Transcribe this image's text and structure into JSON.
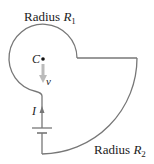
{
  "diagram": {
    "labels": {
      "radius1_prefix": "Radius ",
      "radius1_var": "R",
      "radius1_sub": "1",
      "radius2_prefix": "Radius ",
      "radius2_var": "R",
      "radius2_sub": "2",
      "center": "C",
      "velocity": "v",
      "current": "I"
    },
    "colors": {
      "wire": "#777777",
      "velocity_arrow": "#bbbbbb",
      "text": "#222222"
    }
  }
}
